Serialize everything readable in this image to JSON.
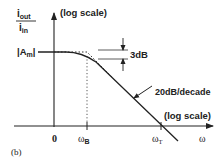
{
  "figure": {
    "label": "(b)",
    "y_axis": {
      "numerator": "i",
      "numerator_sub": "out",
      "denominator": "i",
      "denominator_sub": "in",
      "scale_note": "(log scale)"
    },
    "x_axis": {
      "symbol": "ω",
      "scale_note": "(log scale)",
      "ticks": [
        {
          "main": "0",
          "sub": ""
        },
        {
          "main": "ω",
          "sub": "B"
        },
        {
          "main": "ω",
          "sub": "T"
        }
      ]
    },
    "level_label": {
      "main": "|A",
      "sub": "m",
      "close": "|"
    },
    "annotations": {
      "drop": "3dB",
      "slope": "20dB/decade"
    },
    "colors": {
      "ink": "#222222",
      "background": "#ffffff"
    }
  }
}
